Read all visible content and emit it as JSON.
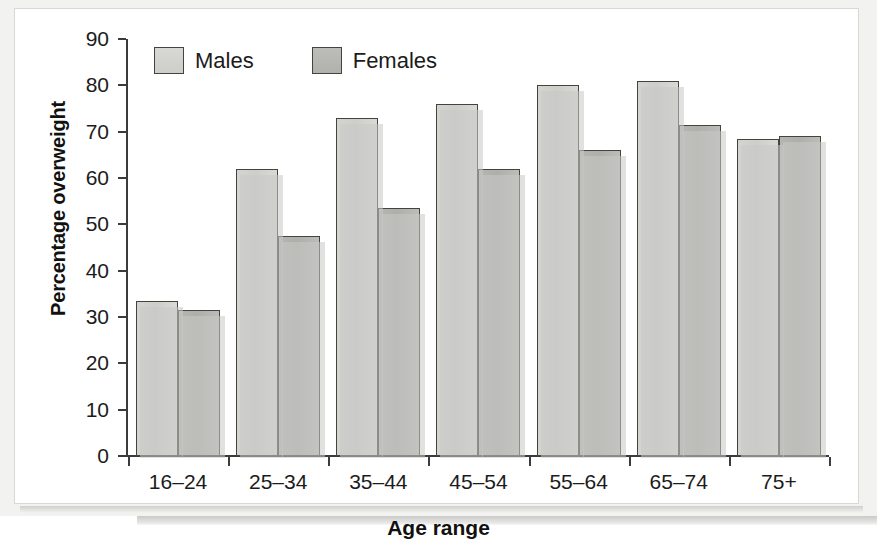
{
  "chart_data": {
    "type": "bar",
    "title": "",
    "xlabel": "Age range",
    "ylabel": "Percentage overweight",
    "categories": [
      "16–24",
      "25–34",
      "35–44",
      "45–54",
      "55–64",
      "65–74",
      "75+"
    ],
    "series": [
      {
        "name": "Males",
        "color": "#cdcdca",
        "values": [
          33.5,
          62.0,
          73.0,
          76.0,
          80.0,
          81.0,
          68.5
        ]
      },
      {
        "name": "Females",
        "color": "#b0b0ac",
        "values": [
          31.5,
          47.5,
          53.5,
          62.0,
          66.0,
          71.5,
          69.0
        ]
      }
    ],
    "ylim": [
      0,
      90
    ],
    "ytick_step": 10,
    "yticks": [
      0,
      10,
      20,
      30,
      40,
      50,
      60,
      70,
      80,
      90
    ],
    "ytick_labels": [
      "0",
      "10",
      "20",
      "30",
      "40",
      "50",
      "60",
      "70",
      "80",
      "90"
    ],
    "grid": false,
    "legend_position": "top-left-inside"
  },
  "legend": {
    "items": [
      {
        "label": "Males"
      },
      {
        "label": "Females"
      }
    ]
  },
  "axes": {
    "x_title": "Age range",
    "y_title": "Percentage overweight"
  }
}
